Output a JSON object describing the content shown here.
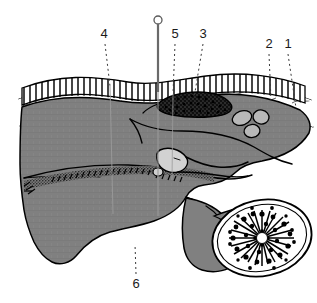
{
  "figure": {
    "background_color": "#ffffff",
    "width": 317,
    "height": 303,
    "style": "black line art with gray tone fills"
  },
  "palette": {
    "ink": "#000000",
    "tissue_gray": "#808080",
    "tissue_gray_dark": "#6f6f6f",
    "light_structure_gray": "#d2d2d2",
    "mid_structure_gray": "#b8b8b8",
    "white": "#ffffff",
    "leader_line": "#3a3a3a",
    "label_text": "#1a1a1a"
  },
  "labels": [
    {
      "id": "label-1",
      "text": "1",
      "x": 288,
      "y": 48,
      "leader": {
        "x1": 288,
        "y1": 54,
        "x2": 296,
        "y2": 108
      }
    },
    {
      "id": "label-2",
      "text": "2",
      "x": 269,
      "y": 48,
      "leader": {
        "x1": 269,
        "y1": 54,
        "x2": 271,
        "y2": 100
      }
    },
    {
      "id": "label-3",
      "text": "3",
      "x": 203,
      "y": 38,
      "leader": {
        "x1": 203,
        "y1": 44,
        "x2": 194,
        "y2": 98
      }
    },
    {
      "id": "label-4",
      "text": "4",
      "x": 104,
      "y": 38,
      "leader": {
        "x1": 105,
        "y1": 44,
        "x2": 110,
        "y2": 86
      }
    },
    {
      "id": "label-5",
      "text": "5",
      "x": 175,
      "y": 38,
      "leader": {
        "x1": 175,
        "y1": 44,
        "x2": 173,
        "y2": 94
      }
    },
    {
      "id": "label-6",
      "text": "6",
      "x": 136,
      "y": 284,
      "leader": {
        "x1": 136,
        "y1": 274,
        "x2": 135,
        "y2": 244
      }
    }
  ],
  "needle": {
    "name": "insertion-needle",
    "head_center_x": 158,
    "head_center_y": 20,
    "head_radius": 4,
    "shaft_x": 158,
    "shaft_top_y": 24,
    "shaft_bottom_y": 92,
    "tract_bottom_y": 216
  },
  "structures": [
    {
      "name": "epithelium-palisade-band",
      "description": "columnar epithelium drawn as a row of brick-like cells along the top surface"
    },
    {
      "name": "connective-tissue-wavy-layer",
      "description": "wavy fiber lines beneath the epithelium"
    },
    {
      "name": "dark-granular-mass",
      "description": "dark stippled oval lesion beneath the epithelium at center"
    },
    {
      "name": "gland-oval-cluster",
      "description": "three gray oval acini on the right side of the tissue layer"
    },
    {
      "name": "light-lens-structure",
      "description": "pale teardrop/lens shaped body at the center of the gray mass"
    },
    {
      "name": "stippled-muscle-band",
      "description": "horizontal stippled band running across the lower gray mass"
    },
    {
      "name": "radiating-node-section",
      "description": "large oval white body with a dense black radiating starburst interior at lower right"
    },
    {
      "name": "gray-tissue-mass",
      "description": "large medium-gray body filling the center of the field"
    }
  ]
}
